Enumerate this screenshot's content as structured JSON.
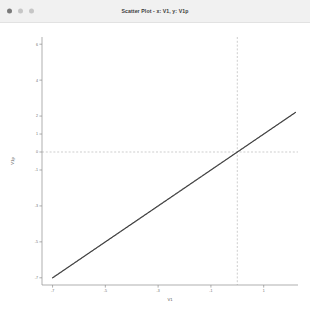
{
  "window": {
    "title": "Scatter Plot - x: V1, y: V1p",
    "controls": [
      {
        "name": "close-button",
        "label": "",
        "color": "#7a7a7a"
      },
      {
        "name": "minimize-button",
        "label": "",
        "color": "#c6c6c6"
      },
      {
        "name": "maximize-button",
        "label": "",
        "color": "#c6c6c6"
      }
    ]
  },
  "chart_data": {
    "type": "scatter",
    "title": "Scatter Plot - x: V1, y: V1p",
    "xlabel": "V1",
    "ylabel": "V1p",
    "xlim": [
      -7.4,
      2.3
    ],
    "ylim": [
      -7.4,
      6.4
    ],
    "grid": false,
    "legend": null,
    "x_ticks": [
      -7,
      -5,
      -3,
      -1,
      1,
      3,
      5
    ],
    "x_tick_labels": [
      "-7",
      "-5",
      "-3",
      "-1",
      "1",
      "3",
      "5"
    ],
    "y_ticks": [
      6,
      4,
      2,
      1,
      0,
      -1,
      -3,
      -5,
      -7
    ],
    "y_tick_labels": [
      "6",
      "4",
      "2",
      "1",
      "0",
      "-1",
      "-3",
      "-5",
      "-7"
    ],
    "series": [
      {
        "name": "V1 vs V1p",
        "marker": "point",
        "color": "#3a3a3a",
        "relationship": "y = x",
        "x": [
          -7.0,
          -6.6,
          -6.2,
          -5.8,
          -5.4,
          -5.0,
          -4.6,
          -4.2,
          -3.8,
          -3.4,
          -3.0,
          -2.6,
          -2.2,
          -1.8,
          -1.4,
          -1.0,
          -0.6,
          -0.2,
          0.2,
          0.6,
          1.0,
          1.4,
          1.8,
          2.2
        ],
        "y": [
          -7.0,
          -6.6,
          -6.2,
          -5.8,
          -5.4,
          -5.0,
          -4.6,
          -4.2,
          -3.8,
          -3.4,
          -3.0,
          -2.6,
          -2.2,
          -1.8,
          -1.4,
          -1.0,
          -0.6,
          -0.2,
          0.2,
          0.6,
          1.0,
          1.4,
          1.8,
          2.2
        ]
      }
    ],
    "reference_lines": [
      {
        "name": "vertical-crosshair",
        "orientation": "vertical",
        "value": 0.0,
        "style": "dashed",
        "color": "#b9b9b9"
      },
      {
        "name": "horizontal-crosshair",
        "orientation": "horizontal",
        "value": 0.0,
        "style": "dashed",
        "color": "#b9b9b9"
      }
    ]
  }
}
